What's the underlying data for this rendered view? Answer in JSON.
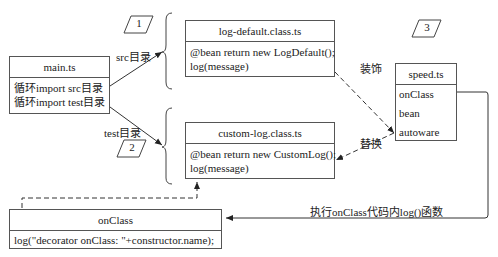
{
  "main": {
    "title": "main.ts",
    "lines": [
      "循环import src目录",
      "循环import test目录"
    ]
  },
  "log_default": {
    "title": "log-default.class.ts",
    "lines": [
      "@bean return new LogDefault();",
      "log(message)"
    ]
  },
  "custom_log": {
    "title": "custom-log.class.ts",
    "lines": [
      "@bean return new CustomLog();",
      "log(message)"
    ]
  },
  "speed": {
    "title": "speed.ts",
    "items": [
      "onClass",
      "bean",
      "autoware"
    ]
  },
  "on_class": {
    "title": "onClass",
    "lines": [
      "log(\"decorator onClass: \"+constructor.name);"
    ]
  },
  "labels": {
    "src": "src目录",
    "test": "test目录",
    "decorate": "装饰",
    "replace": "替换",
    "execute": "执行onClass代码内log()函数"
  },
  "steps": [
    "1",
    "2",
    "3"
  ]
}
